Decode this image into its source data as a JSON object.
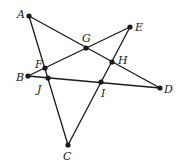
{
  "diagram": {
    "type": "pentagram",
    "points": [
      {
        "id": "A",
        "label": "A",
        "x": 29,
        "y": 16,
        "lx": 17,
        "ly": 18
      },
      {
        "id": "E",
        "label": "E",
        "x": 130,
        "y": 27,
        "lx": 135,
        "ly": 31
      },
      {
        "id": "G",
        "label": "G",
        "x": 86,
        "y": 48,
        "lx": 82,
        "ly": 42
      },
      {
        "id": "H",
        "label": "H",
        "x": 112,
        "y": 62,
        "lx": 118,
        "ly": 64
      },
      {
        "id": "F",
        "label": "F",
        "x": 45,
        "y": 68,
        "lx": 35,
        "ly": 68
      },
      {
        "id": "B",
        "label": "B",
        "x": 28,
        "y": 76,
        "lx": 16,
        "ly": 81
      },
      {
        "id": "J",
        "label": "J",
        "x": 48,
        "y": 78,
        "lx": 37,
        "ly": 93
      },
      {
        "id": "I",
        "label": "I",
        "x": 101,
        "y": 82,
        "lx": 101,
        "ly": 97
      },
      {
        "id": "D",
        "label": "D",
        "x": 160,
        "y": 88,
        "lx": 164,
        "ly": 93
      },
      {
        "id": "C",
        "label": "C",
        "x": 68,
        "y": 145,
        "lx": 63,
        "ly": 160
      }
    ],
    "segments": [
      {
        "from": "A",
        "to": "D"
      },
      {
        "from": "A",
        "to": "C"
      },
      {
        "from": "B",
        "to": "E"
      },
      {
        "from": "B",
        "to": "D"
      },
      {
        "from": "C",
        "to": "E"
      }
    ],
    "colors": {
      "line": "#1a1a1a",
      "point": "#1a1a1a",
      "background": "#ffffff"
    }
  }
}
